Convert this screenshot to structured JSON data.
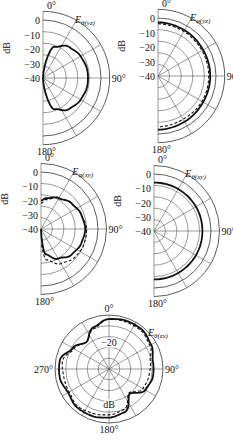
{
  "chart_data": [
    {
      "type": "polar",
      "id": "theta_yz",
      "title": "Eθ(yz)",
      "title_main": "E",
      "title_sub": "θ(yz)",
      "ylabel": "dB",
      "half": "right",
      "r_ticks": [
        0,
        -10,
        -20,
        -30,
        -40
      ],
      "r_range": [
        -40,
        0
      ],
      "angle_labels": [
        "0°",
        "90°",
        "180°"
      ],
      "center": [
        43,
        78
      ],
      "radius": 58,
      "series": [
        {
          "name": "measured",
          "style": "solid",
          "angles": [
            0,
            20,
            40,
            60,
            80,
            90,
            100,
            120,
            140,
            160,
            180
          ],
          "values": [
            -40,
            -17,
            -12,
            -10,
            -9,
            -9,
            -9,
            -10,
            -12,
            -17,
            -40
          ]
        }
      ]
    },
    {
      "type": "polar",
      "id": "phi_yz",
      "title": "Eφ(yz)",
      "title_main": "E",
      "title_sub": "φ(yz)",
      "ylabel": "dB",
      "half": "right",
      "r_ticks": [
        0,
        -10,
        -20,
        -30,
        -40
      ],
      "r_range": [
        -40,
        0
      ],
      "angle_labels": [
        "0°",
        "90°",
        "180°"
      ],
      "center": [
        158,
        76
      ],
      "radius": 58,
      "series": [
        {
          "name": "measured",
          "style": "solid",
          "angles": [
            0,
            30,
            60,
            90,
            120,
            150,
            180
          ],
          "values": [
            -3,
            -3.5,
            -4,
            -4,
            -4,
            -3.5,
            -3
          ]
        },
        {
          "name": "simulated",
          "style": "dashed",
          "angles": [
            0,
            30,
            60,
            90,
            120,
            150,
            180
          ],
          "values": [
            -4,
            -4.5,
            -5,
            -5,
            -5,
            -5.5,
            -5
          ]
        }
      ]
    },
    {
      "type": "polar",
      "id": "phi_xy",
      "title": "Eφ(xy)",
      "title_main": "E",
      "title_sub": "φ(xy)",
      "ylabel": "dB",
      "half": "right",
      "r_ticks": [
        0,
        -10,
        -20,
        -30,
        -40
      ],
      "r_range": [
        -40,
        0
      ],
      "angle_labels": [
        "0°",
        "90°",
        "180°"
      ],
      "center": [
        41,
        229
      ],
      "radius": 57,
      "series": [
        {
          "name": "measured",
          "style": "solid",
          "angles": [
            0,
            10,
            30,
            50,
            70,
            90,
            110,
            130,
            150,
            170,
            180
          ],
          "values": [
            -20,
            -18,
            -15,
            -12,
            -10,
            -9,
            -10,
            -12,
            -16,
            -22,
            -40
          ]
        },
        {
          "name": "simulated",
          "style": "dashed",
          "angles": [
            0,
            10,
            30,
            50,
            70,
            90,
            110,
            130,
            150,
            170,
            180
          ],
          "values": [
            -22,
            -19,
            -15,
            -12,
            -10,
            -8,
            -8,
            -9,
            -12,
            -18,
            -30
          ]
        }
      ]
    },
    {
      "type": "polar",
      "id": "theta_xy",
      "title": "Eθ(xy)",
      "title_main": "E",
      "title_sub": "θ(xy)",
      "ylabel": "dB",
      "half": "right",
      "r_ticks": [
        0,
        -10,
        -20,
        -30,
        -40
      ],
      "r_range": [
        -40,
        0
      ],
      "angle_labels": [
        "0°",
        "90°",
        "180°"
      ],
      "center": [
        154,
        231
      ],
      "radius": 57,
      "series": [
        {
          "name": "measured",
          "style": "solid",
          "angles": [
            0,
            30,
            60,
            90,
            120,
            150,
            180
          ],
          "values": [
            -6,
            -6,
            -6,
            -6,
            -6,
            -6,
            -6
          ]
        }
      ]
    },
    {
      "type": "polar",
      "id": "theta_zx",
      "title": "Eθ(zx)",
      "title_main": "E",
      "title_sub": "θ(zx)",
      "ylabel": "dB",
      "half": "full",
      "r_ticks": [
        -20
      ],
      "r_range": [
        -40,
        0
      ],
      "angle_labels": [
        "0°",
        "90°",
        "180°",
        "270°"
      ],
      "center": [
        109,
        369
      ],
      "radius": 54,
      "series": [
        {
          "name": "measured",
          "style": "solid",
          "angles": [
            0,
            20,
            40,
            60,
            80,
            100,
            120,
            140,
            160,
            180,
            200,
            220,
            240,
            260,
            280,
            300,
            320,
            340,
            360
          ],
          "values": [
            -3,
            -2,
            -2,
            -4,
            -7,
            -7,
            -9,
            -16,
            -6,
            -4,
            -3,
            -3,
            -5,
            -3,
            -3,
            -9,
            -14,
            -7,
            -3
          ]
        },
        {
          "name": "simulated",
          "style": "dashed",
          "angles": [
            0,
            20,
            40,
            60,
            80,
            100,
            120,
            140,
            160,
            180,
            200,
            220,
            240,
            260,
            280,
            300,
            320,
            340,
            360
          ],
          "values": [
            -3,
            -3,
            -3,
            -5,
            -9,
            -10,
            -11,
            -17,
            -8,
            -6,
            -5,
            -4,
            -6,
            -6,
            -5,
            -10,
            -14,
            -8,
            -3
          ]
        }
      ]
    }
  ]
}
